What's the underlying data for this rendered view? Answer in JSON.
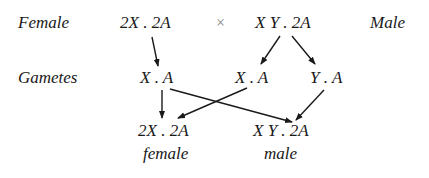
{
  "parents": {
    "female_label": "Female",
    "female_genotype": "2X . 2A",
    "cross_symbol": "×",
    "male_genotype": "X Y . 2A",
    "male_label": "Male"
  },
  "gametes": {
    "label": "Gametes",
    "female_gamete": "X . A",
    "male_gamete_x": "X . A",
    "male_gamete_y": "Y . A"
  },
  "offspring": [
    {
      "genotype": "2X . 2A",
      "sex": "female"
    },
    {
      "genotype": "X Y . 2A",
      "sex": "male"
    }
  ]
}
